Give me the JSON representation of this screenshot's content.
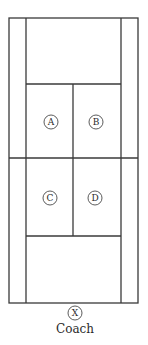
{
  "diagram": {
    "type": "tennis-court-positions",
    "line_color": "#3a3a3a",
    "background": "#ffffff",
    "court": {
      "outer": {
        "x1": 9,
        "y1": 18,
        "x2": 138,
        "y2": 303
      },
      "singles_left_x": 26,
      "singles_right_x": 121,
      "far_service_line_y": 84,
      "net_y": 158,
      "near_service_line_y": 236,
      "center_service_line_x": 73
    },
    "players": [
      {
        "id": "A",
        "label": "A",
        "cx": 51,
        "cy": 122
      },
      {
        "id": "B",
        "label": "B",
        "cx": 96,
        "cy": 122
      },
      {
        "id": "C",
        "label": "C",
        "cx": 50,
        "cy": 198
      },
      {
        "id": "D",
        "label": "D",
        "cx": 95,
        "cy": 198
      }
    ],
    "coach": {
      "marker": "X",
      "label": "Coach",
      "cx": 75,
      "cy": 313
    }
  }
}
